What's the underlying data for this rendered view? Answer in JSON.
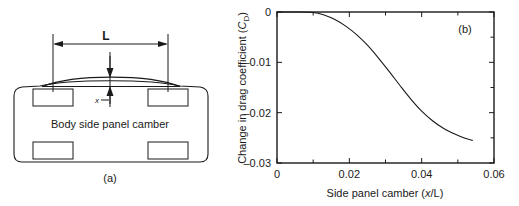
{
  "figure": {
    "panels": [
      {
        "tag": "(a)",
        "type": "diagram",
        "title": "Body side panel camber",
        "dimension_labels": {
          "span": "L",
          "offset": "x"
        },
        "elements": [
          "car-plan-outline",
          "cambered-side-panel-curve",
          "four-wheels",
          "span-dimension-line",
          "camber-offset-arrows"
        ]
      },
      {
        "tag": "(b)",
        "type": "chart"
      }
    ]
  },
  "chart_data": {
    "type": "line",
    "title": "",
    "xlabel": "Side panel camber (x/L)",
    "ylabel": "Change in drag coefficient (C_D)",
    "xlabel_parts": {
      "pre": "Side panel camber (",
      "italic": "x",
      "post": "/L)"
    },
    "ylabel_parts": {
      "pre": "Change in drag coefficient (",
      "italic": "C",
      "sub": "D",
      "post": ")"
    },
    "xlim": [
      0,
      0.06
    ],
    "ylim": [
      -0.03,
      0
    ],
    "xticks": [
      0,
      0.02,
      0.04,
      0.06
    ],
    "xticklabels": [
      "0",
      "0.02",
      "0.04",
      "0.06"
    ],
    "xminorticks": [
      0.01,
      0.03,
      0.05
    ],
    "yticks": [
      0,
      -0.01,
      -0.02,
      -0.03
    ],
    "yticklabels": [
      "0",
      "–0.01",
      "–0.02",
      "–0.03"
    ],
    "grid": false,
    "legend": false,
    "series": [
      {
        "name": "Change in drag coefficient",
        "x": [
          0.0,
          0.005,
          0.01,
          0.013,
          0.016,
          0.019,
          0.022,
          0.025,
          0.028,
          0.031,
          0.034,
          0.037,
          0.04,
          0.043,
          0.046,
          0.049,
          0.052,
          0.054
        ],
        "values": [
          0.0,
          0.0,
          -0.0001,
          -0.0006,
          -0.0015,
          -0.0028,
          -0.0045,
          -0.0066,
          -0.0091,
          -0.0118,
          -0.0146,
          -0.0173,
          -0.0197,
          -0.0216,
          -0.0231,
          -0.0242,
          -0.0251,
          -0.0255
        ]
      }
    ]
  },
  "colors": {
    "ink": "#1a1a1a",
    "background": "#ffffff"
  }
}
